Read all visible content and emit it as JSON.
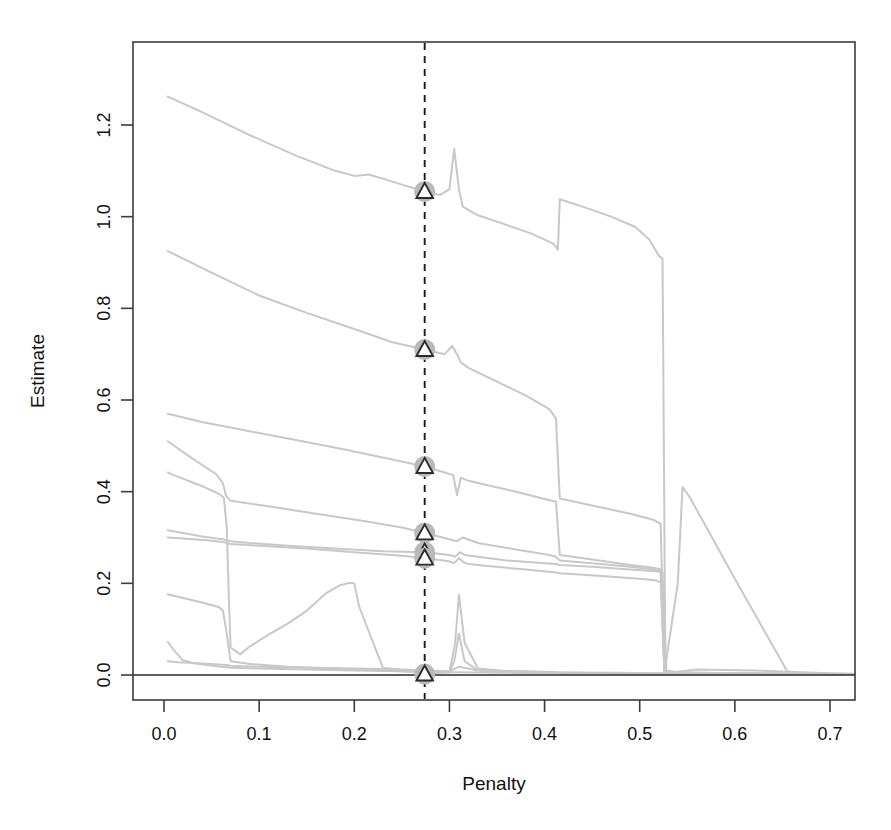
{
  "figure": {
    "background_color": "#ffffff",
    "frame_color": "#3b3b3b",
    "series_color": "#c8c8c8",
    "marker_halo_color": "#b9b9b9",
    "marker_edge_color": "#2b2b2b",
    "marker_fill_color": "#ffffff",
    "vline_color": "#1a1a1a"
  },
  "chart_data": {
    "type": "line",
    "title": "",
    "subtitle": "",
    "xlabel": "Penalty",
    "ylabel": "Estimate",
    "xlim": [
      -0.025,
      0.73
    ],
    "ylim": [
      -0.05,
      1.34
    ],
    "xticks": [
      0.0,
      0.1,
      0.2,
      0.3,
      0.4,
      0.5,
      0.6,
      0.7
    ],
    "xticklabels": [
      "0.0",
      "0.1",
      "0.2",
      "0.3",
      "0.4",
      "0.5",
      "0.6",
      "0.7"
    ],
    "yticks": [
      0.0,
      0.2,
      0.4,
      0.6,
      0.8,
      1.0,
      1.2
    ],
    "yticklabels": [
      "0.0",
      "0.2",
      "0.4",
      "0.6",
      "0.8",
      "1.0",
      "1.2"
    ],
    "grid": false,
    "legend": "none",
    "annotations": [
      {
        "name": "selected-penalty-vline",
        "kind": "vertical-dashed-line",
        "x": 0.274,
        "style": "dashed"
      },
      {
        "name": "zero-reference-line",
        "kind": "horizontal-line",
        "y": 0.0,
        "style": "solid"
      }
    ],
    "selected_penalty": 0.274,
    "marker_shape": "triangle",
    "markers": [
      {
        "x": 0.274,
        "y": 1.055
      },
      {
        "x": 0.274,
        "y": 0.71
      },
      {
        "x": 0.274,
        "y": 0.455
      },
      {
        "x": 0.274,
        "y": 0.31
      },
      {
        "x": 0.274,
        "y": 0.268
      },
      {
        "x": 0.274,
        "y": 0.255
      },
      {
        "x": 0.274,
        "y": 0.002
      }
    ],
    "series": [
      {
        "name": "path-1",
        "x": [
          0.004,
          0.04,
          0.09,
          0.14,
          0.18,
          0.2,
          0.215,
          0.23,
          0.25,
          0.274,
          0.29,
          0.3,
          0.305,
          0.31,
          0.314,
          0.318,
          0.33,
          0.36,
          0.385,
          0.4,
          0.41,
          0.414,
          0.416,
          0.44,
          0.47,
          0.495,
          0.51,
          0.52,
          0.524,
          0.527,
          0.54,
          0.6,
          0.66,
          0.7,
          0.726
        ],
        "y": [
          1.262,
          1.228,
          1.178,
          1.132,
          1.1,
          1.089,
          1.092,
          1.083,
          1.07,
          1.055,
          1.047,
          1.06,
          1.148,
          1.06,
          1.022,
          1.017,
          1.003,
          0.982,
          0.964,
          0.95,
          0.94,
          0.928,
          1.038,
          1.022,
          1.0,
          0.978,
          0.95,
          0.915,
          0.908,
          0.01,
          0.006,
          0.004,
          0.003,
          0.002,
          0.002
        ]
      },
      {
        "name": "path-2",
        "x": [
          0.004,
          0.05,
          0.1,
          0.15,
          0.2,
          0.24,
          0.274,
          0.295,
          0.303,
          0.308,
          0.312,
          0.32,
          0.35,
          0.38,
          0.405,
          0.412,
          0.416,
          0.45,
          0.49,
          0.515,
          0.522,
          0.526,
          0.53,
          0.56,
          0.62,
          0.7,
          0.726
        ],
        "y": [
          0.925,
          0.878,
          0.828,
          0.79,
          0.755,
          0.726,
          0.71,
          0.7,
          0.718,
          0.7,
          0.682,
          0.67,
          0.64,
          0.61,
          0.58,
          0.56,
          0.385,
          0.37,
          0.352,
          0.338,
          0.33,
          0.008,
          0.005,
          0.004,
          0.003,
          0.002,
          0.002
        ]
      },
      {
        "name": "path-3",
        "x": [
          0.004,
          0.04,
          0.09,
          0.14,
          0.19,
          0.24,
          0.274,
          0.295,
          0.304,
          0.308,
          0.312,
          0.32,
          0.34,
          0.37,
          0.4,
          0.412,
          0.416,
          0.45,
          0.49,
          0.515,
          0.522,
          0.526,
          0.54,
          0.545,
          0.552,
          0.6,
          0.655,
          0.665,
          0.7,
          0.726
        ],
        "y": [
          0.57,
          0.552,
          0.532,
          0.512,
          0.492,
          0.47,
          0.455,
          0.442,
          0.436,
          0.392,
          0.43,
          0.424,
          0.414,
          0.4,
          0.384,
          0.378,
          0.262,
          0.252,
          0.24,
          0.234,
          0.23,
          0.006,
          0.2,
          0.41,
          0.39,
          0.21,
          0.008,
          0.004,
          0.003,
          0.002
        ]
      },
      {
        "name": "path-4",
        "x": [
          0.004,
          0.03,
          0.055,
          0.062,
          0.065,
          0.07,
          0.11,
          0.16,
          0.21,
          0.25,
          0.274,
          0.3,
          0.308,
          0.314,
          0.33,
          0.37,
          0.405,
          0.412,
          0.416,
          0.45,
          0.49,
          0.515,
          0.522,
          0.526,
          0.56,
          0.63,
          0.7,
          0.726
        ],
        "y": [
          0.51,
          0.472,
          0.438,
          0.418,
          0.392,
          0.38,
          0.368,
          0.352,
          0.336,
          0.322,
          0.31,
          0.296,
          0.292,
          0.3,
          0.288,
          0.274,
          0.262,
          0.258,
          0.25,
          0.244,
          0.236,
          0.23,
          0.226,
          0.005,
          0.004,
          0.003,
          0.002,
          0.002
        ]
      },
      {
        "name": "path-5",
        "x": [
          0.004,
          0.01,
          0.018,
          0.03,
          0.04,
          0.055,
          0.06,
          0.063,
          0.066,
          0.068,
          0.07,
          0.08,
          0.09,
          0.11,
          0.13,
          0.15,
          0.17,
          0.185,
          0.195,
          0.2,
          0.205,
          0.23,
          0.26,
          0.274,
          0.3,
          0.306,
          0.31,
          0.316,
          0.33,
          0.36,
          0.4,
          0.412,
          0.416,
          0.46,
          0.52,
          0.526,
          0.6,
          0.7,
          0.726
        ],
        "y": [
          0.442,
          0.436,
          0.43,
          0.42,
          0.412,
          0.398,
          0.392,
          0.386,
          0.32,
          0.18,
          0.06,
          0.045,
          0.062,
          0.088,
          0.112,
          0.14,
          0.178,
          0.196,
          0.201,
          0.2,
          0.15,
          0.016,
          0.008,
          0.004,
          0.006,
          0.07,
          0.175,
          0.07,
          0.014,
          0.008,
          0.006,
          0.005,
          0.004,
          0.004,
          0.003,
          0.003,
          0.003,
          0.002,
          0.002
        ]
      },
      {
        "name": "path-6",
        "x": [
          0.004,
          0.02,
          0.04,
          0.062,
          0.066,
          0.07,
          0.09,
          0.13,
          0.18,
          0.23,
          0.274,
          0.3,
          0.306,
          0.311,
          0.316,
          0.33,
          0.36,
          0.4,
          0.412,
          0.416,
          0.45,
          0.49,
          0.52,
          0.524,
          0.528,
          0.58,
          0.66,
          0.7,
          0.726
        ],
        "y": [
          0.316,
          0.31,
          0.302,
          0.296,
          0.294,
          0.292,
          0.288,
          0.282,
          0.276,
          0.27,
          0.268,
          0.262,
          0.258,
          0.268,
          0.262,
          0.258,
          0.25,
          0.244,
          0.242,
          0.24,
          0.236,
          0.23,
          0.226,
          0.224,
          0.006,
          0.004,
          0.003,
          0.002,
          0.002
        ]
      },
      {
        "name": "path-7",
        "x": [
          0.004,
          0.02,
          0.045,
          0.062,
          0.066,
          0.07,
          0.1,
          0.15,
          0.2,
          0.25,
          0.274,
          0.3,
          0.305,
          0.31,
          0.315,
          0.32,
          0.34,
          0.38,
          0.41,
          0.416,
          0.46,
          0.5,
          0.518,
          0.522,
          0.526,
          0.56,
          0.64,
          0.7,
          0.726
        ],
        "y": [
          0.3,
          0.298,
          0.294,
          0.29,
          0.288,
          0.286,
          0.282,
          0.276,
          0.268,
          0.26,
          0.255,
          0.248,
          0.244,
          0.255,
          0.246,
          0.242,
          0.238,
          0.23,
          0.224,
          0.222,
          0.216,
          0.21,
          0.206,
          0.202,
          0.005,
          0.004,
          0.003,
          0.002,
          0.002
        ]
      },
      {
        "name": "path-8",
        "x": [
          0.004,
          0.02,
          0.04,
          0.058,
          0.062,
          0.066,
          0.07,
          0.09,
          0.13,
          0.18,
          0.23,
          0.274,
          0.3,
          0.305,
          0.31,
          0.316,
          0.33,
          0.37,
          0.41,
          0.416,
          0.47,
          0.52,
          0.527,
          0.6,
          0.7,
          0.726
        ],
        "y": [
          0.176,
          0.168,
          0.158,
          0.148,
          0.14,
          0.09,
          0.03,
          0.024,
          0.018,
          0.014,
          0.01,
          0.006,
          0.006,
          0.03,
          0.09,
          0.03,
          0.01,
          0.006,
          0.005,
          0.004,
          0.004,
          0.003,
          0.003,
          0.003,
          0.002,
          0.002
        ]
      },
      {
        "name": "path-9",
        "x": [
          0.004,
          0.012,
          0.02,
          0.03,
          0.045,
          0.06,
          0.07,
          0.1,
          0.15,
          0.2,
          0.25,
          0.274,
          0.31,
          0.36,
          0.416,
          0.47,
          0.527,
          0.6,
          0.7,
          0.726
        ],
        "y": [
          0.072,
          0.05,
          0.032,
          0.026,
          0.022,
          0.018,
          0.016,
          0.014,
          0.012,
          0.01,
          0.008,
          0.006,
          0.006,
          0.005,
          0.004,
          0.004,
          0.003,
          0.003,
          0.002,
          0.002
        ]
      },
      {
        "name": "path-10",
        "x": [
          0.004,
          0.015,
          0.03,
          0.05,
          0.065,
          0.07,
          0.1,
          0.15,
          0.2,
          0.25,
          0.274,
          0.3,
          0.31,
          0.33,
          0.38,
          0.416,
          0.47,
          0.527,
          0.56,
          0.62,
          0.7,
          0.726
        ],
        "y": [
          0.03,
          0.028,
          0.026,
          0.024,
          0.022,
          0.02,
          0.018,
          0.016,
          0.014,
          0.012,
          0.01,
          0.008,
          0.018,
          0.01,
          0.008,
          0.006,
          0.005,
          0.004,
          0.012,
          0.01,
          0.004,
          0.003
        ]
      }
    ]
  }
}
